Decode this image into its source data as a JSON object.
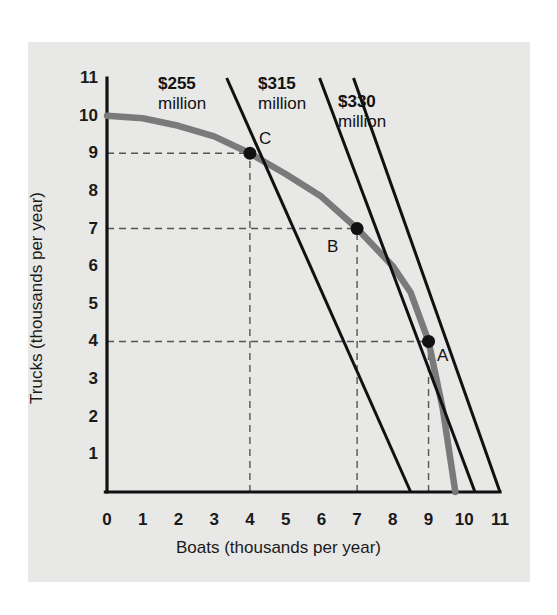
{
  "figure": {
    "background_color": "#e8e8e6",
    "rule_color": "#4a4a4a"
  },
  "axes": {
    "x_label": "Boats (thousands per year)",
    "y_label": "Trucks (thousands per year)",
    "x_ticks": [
      "0",
      "1",
      "2",
      "3",
      "4",
      "5",
      "6",
      "7",
      "8",
      "9",
      "10",
      "11"
    ],
    "y_ticks": [
      "1",
      "2",
      "3",
      "4",
      "5",
      "6",
      "7",
      "8",
      "9",
      "10",
      "11"
    ]
  },
  "annotations": {
    "cost_255": {
      "amount": "$255",
      "unit": "million"
    },
    "cost_315": {
      "amount": "$315",
      "unit": "million"
    },
    "cost_330": {
      "amount": "$330",
      "unit": "million"
    },
    "point_a": "A",
    "point_b": "B",
    "point_c": "C"
  },
  "colors": {
    "ppf_curve": "#7a7a7a",
    "isocost_line": "#111111",
    "axis": "#111111",
    "dashed_guide": "#555555",
    "marker": "#111111"
  },
  "chart_data": {
    "type": "line",
    "title": "",
    "xlabel": "Boats (thousands per year)",
    "ylabel": "Trucks (thousands per year)",
    "xlim": [
      0,
      11
    ],
    "ylim": [
      0,
      11
    ],
    "grid": false,
    "legend": "none",
    "series": [
      {
        "name": "Production possibilities frontier (PPF)",
        "type": "curve",
        "color": "#7a7a7a",
        "points": [
          [
            0.0,
            10.0
          ],
          [
            1.0,
            9.93
          ],
          [
            2.0,
            9.73
          ],
          [
            3.0,
            9.45
          ],
          [
            4.0,
            9.0
          ],
          [
            5.0,
            8.45
          ],
          [
            6.0,
            7.85
          ],
          [
            7.0,
            7.0
          ],
          [
            8.0,
            6.0
          ],
          [
            8.5,
            5.3
          ],
          [
            9.0,
            4.0
          ],
          [
            9.4,
            2.2
          ],
          [
            9.75,
            0.0
          ]
        ]
      },
      {
        "name": "$255 million isocost line",
        "type": "line",
        "color": "#111111",
        "label": "$255 million",
        "points": [
          [
            3.35,
            11.0
          ],
          [
            8.5,
            0.0
          ]
        ]
      },
      {
        "name": "$315 million isocost line",
        "type": "line",
        "color": "#111111",
        "label": "$315 million",
        "points": [
          [
            5.95,
            11.0
          ],
          [
            10.3,
            0.0
          ]
        ]
      },
      {
        "name": "$330 million isocost line",
        "type": "line",
        "color": "#111111",
        "label": "$330 million",
        "points": [
          [
            6.9,
            11.0
          ],
          [
            11.0,
            0.0
          ]
        ]
      }
    ],
    "points": [
      {
        "name": "A",
        "x": 9.0,
        "y": 4.0,
        "label": "A"
      },
      {
        "name": "B",
        "x": 7.0,
        "y": 7.0,
        "label": "B"
      },
      {
        "name": "C",
        "x": 4.0,
        "y": 9.0,
        "label": "C"
      }
    ],
    "guide_lines": [
      {
        "orientation": "horizontal",
        "value": 9.0,
        "from": 0.0,
        "to": 4.0
      },
      {
        "orientation": "vertical",
        "value": 4.0,
        "from": 0.0,
        "to": 9.0
      },
      {
        "orientation": "horizontal",
        "value": 7.0,
        "from": 0.0,
        "to": 7.0
      },
      {
        "orientation": "vertical",
        "value": 7.0,
        "from": 0.0,
        "to": 7.0
      },
      {
        "orientation": "horizontal",
        "value": 4.0,
        "from": 0.0,
        "to": 9.0
      },
      {
        "orientation": "vertical",
        "value": 9.0,
        "from": 0.0,
        "to": 4.0
      }
    ]
  }
}
